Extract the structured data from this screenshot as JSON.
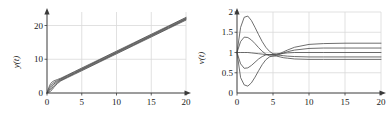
{
  "figure": {
    "background": "#ffffff",
    "grid_color": "#d9d9d9",
    "axis_color": "#3a3a3a",
    "curve_color": "#4a4a4a"
  },
  "chart_data": [
    {
      "id": "left",
      "type": "line",
      "title": "",
      "xlabel": "",
      "ylabel": "y(t)",
      "xlim": [
        0,
        20
      ],
      "ylim": [
        0,
        24
      ],
      "xticks": [
        0,
        5,
        10,
        15,
        20
      ],
      "yticks": [
        0,
        10,
        20
      ],
      "xticklabels": [
        "0",
        "5",
        "10",
        "15",
        "20"
      ],
      "yticklabels": [
        "0",
        "10",
        "20"
      ],
      "grid": true,
      "legend": "none",
      "series": [
        {
          "name": "y1",
          "x": [
            0,
            0.25,
            0.5,
            0.75,
            1,
            1.5,
            2,
            3,
            4,
            5,
            7.5,
            10,
            12.5,
            15,
            17.5,
            20
          ],
          "y": [
            0.0,
            1.6,
            2.7,
            3.3,
            3.6,
            4.0,
            4.4,
            5.4,
            6.4,
            7.4,
            9.9,
            12.4,
            14.9,
            17.4,
            19.9,
            22.4
          ]
        },
        {
          "name": "y2",
          "x": [
            0,
            0.25,
            0.5,
            0.75,
            1,
            1.5,
            2,
            3,
            4,
            5,
            7.5,
            10,
            12.5,
            15,
            17.5,
            20
          ],
          "y": [
            0.0,
            1.1,
            2.0,
            2.7,
            3.1,
            3.7,
            4.2,
            5.2,
            6.2,
            7.2,
            9.7,
            12.2,
            14.7,
            17.2,
            19.7,
            22.2
          ]
        },
        {
          "name": "y3",
          "x": [
            0,
            0.25,
            0.5,
            0.75,
            1,
            1.5,
            2,
            3,
            4,
            5,
            7.5,
            10,
            12.5,
            15,
            17.5,
            20
          ],
          "y": [
            0.0,
            0.7,
            1.4,
            2.1,
            2.7,
            3.4,
            4.0,
            5.0,
            6.0,
            7.0,
            9.5,
            12.0,
            14.5,
            17.0,
            19.5,
            22.0
          ]
        },
        {
          "name": "y4",
          "x": [
            0,
            0.25,
            0.5,
            0.75,
            1,
            1.5,
            2,
            3,
            4,
            5,
            7.5,
            10,
            12.5,
            15,
            17.5,
            20
          ],
          "y": [
            0.0,
            0.4,
            0.9,
            1.5,
            2.2,
            3.1,
            3.8,
            4.8,
            5.8,
            6.8,
            9.3,
            11.8,
            14.3,
            16.8,
            19.3,
            21.8
          ]
        },
        {
          "name": "y5",
          "x": [
            0,
            0.25,
            0.5,
            0.75,
            1,
            1.5,
            2,
            3,
            4,
            5,
            7.5,
            10,
            12.5,
            15,
            17.5,
            20
          ],
          "y": [
            0.0,
            0.2,
            0.5,
            1.0,
            1.7,
            2.8,
            3.6,
            4.6,
            5.6,
            6.6,
            9.1,
            11.6,
            14.1,
            16.6,
            19.1,
            21.6
          ]
        }
      ]
    },
    {
      "id": "right",
      "type": "line",
      "title": "",
      "xlabel": "",
      "ylabel": "v(t)",
      "xlim": [
        0,
        20
      ],
      "ylim": [
        0,
        2
      ],
      "xticks": [
        0,
        5,
        10,
        15,
        20
      ],
      "yticks": [
        0,
        0.5,
        1,
        1.5,
        2
      ],
      "xticklabels": [
        "0",
        "5",
        "10",
        "15",
        "20"
      ],
      "yticklabels": [
        "0",
        "0.5",
        "1",
        "1.5",
        "2"
      ],
      "grid": true,
      "legend": "none",
      "series": [
        {
          "name": "v1",
          "x": [
            0,
            0.5,
            1,
            1.5,
            2,
            2.5,
            3,
            3.5,
            4,
            4.5,
            5,
            5.5,
            6,
            6.5,
            7,
            8,
            10,
            12,
            15,
            20
          ],
          "y": [
            1.0,
            1.62,
            1.87,
            1.9,
            1.79,
            1.62,
            1.44,
            1.27,
            1.13,
            1.03,
            0.97,
            0.96,
            0.98,
            1.02,
            1.06,
            1.13,
            1.2,
            1.22,
            1.23,
            1.23
          ]
        },
        {
          "name": "v2",
          "x": [
            0,
            0.5,
            1,
            1.5,
            2,
            2.5,
            3,
            3.5,
            4,
            4.5,
            5,
            5.5,
            6,
            6.5,
            7,
            8,
            10,
            12,
            15,
            20
          ],
          "y": [
            1.0,
            1.27,
            1.38,
            1.37,
            1.31,
            1.22,
            1.12,
            1.03,
            0.96,
            0.92,
            0.91,
            0.93,
            0.96,
            0.99,
            1.02,
            1.06,
            1.1,
            1.11,
            1.11,
            1.11
          ]
        },
        {
          "name": "v3",
          "x": [
            0,
            0.5,
            1,
            1.5,
            2,
            2.5,
            3,
            3.5,
            4,
            4.5,
            5,
            5.5,
            6,
            6.5,
            7,
            8,
            10,
            12,
            15,
            20
          ],
          "y": [
            1.0,
            1.0,
            1.0,
            1.0,
            0.99,
            0.98,
            0.97,
            0.96,
            0.95,
            0.95,
            0.95,
            0.96,
            0.97,
            0.98,
            0.99,
            1.0,
            1.0,
            1.0,
            1.0,
            1.0
          ]
        },
        {
          "name": "v4",
          "x": [
            0,
            0.5,
            1,
            1.5,
            2,
            2.5,
            3,
            3.5,
            4,
            4.5,
            5,
            5.5,
            6,
            6.5,
            7,
            8,
            10,
            12,
            15,
            20
          ],
          "y": [
            1.0,
            0.72,
            0.61,
            0.62,
            0.68,
            0.76,
            0.84,
            0.9,
            0.94,
            0.95,
            0.95,
            0.94,
            0.93,
            0.92,
            0.91,
            0.9,
            0.89,
            0.89,
            0.89,
            0.89
          ]
        },
        {
          "name": "v5",
          "x": [
            0,
            0.5,
            1,
            1.5,
            2,
            2.5,
            3,
            3.5,
            4,
            4.5,
            5,
            5.5,
            6,
            6.5,
            7,
            8,
            10,
            12,
            15,
            20
          ],
          "y": [
            1.0,
            0.38,
            0.2,
            0.17,
            0.25,
            0.39,
            0.55,
            0.7,
            0.82,
            0.89,
            0.92,
            0.91,
            0.89,
            0.87,
            0.86,
            0.84,
            0.83,
            0.83,
            0.83,
            0.83
          ]
        }
      ]
    }
  ]
}
